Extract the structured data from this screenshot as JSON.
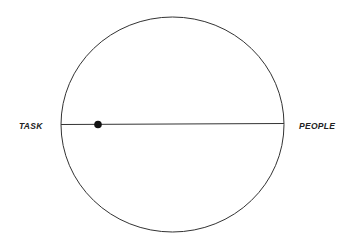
{
  "diagram": {
    "left_label": "TASK",
    "right_label": "PEOPLE",
    "shape": "circle-with-horizontal-axis",
    "marker_position_fraction": 0.17,
    "colors": {
      "stroke": "#333333",
      "marker": "#111111",
      "background": "#ffffff"
    }
  }
}
